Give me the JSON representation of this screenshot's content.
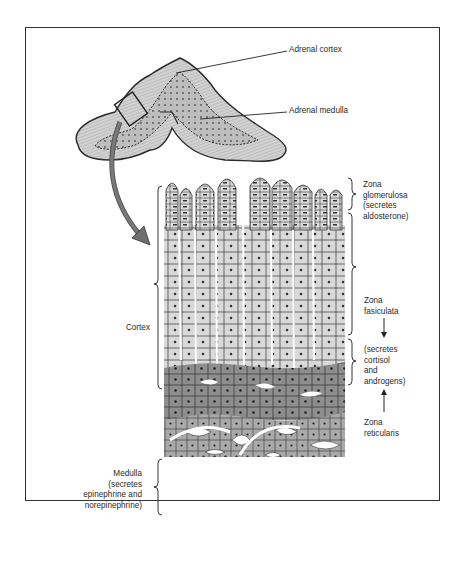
{
  "diagram": {
    "colors": {
      "outline": "#2b2b2b",
      "gland_fill": "#c9c9c9",
      "cortex_cells_light": "#d6d6d6",
      "reticularis_cells": "#8f8f8f",
      "medulla_cells": "#a8a8a8",
      "arrow": "#6f6f6f",
      "background": "#ffffff"
    },
    "gland_labels": {
      "cortex": "Adrenal cortex",
      "medulla": "Adrenal medulla"
    },
    "zones": {
      "glomerulosa": {
        "line1": "Zona",
        "line2": "glomerulosa",
        "line3": "(secretes",
        "line4": "aldosterone)"
      },
      "fasciculata": {
        "line1": "Zona",
        "line2": "fasiculata"
      },
      "fasciculata_reticularis_secretion": {
        "line1": "(secretes",
        "line2": "cortisol",
        "line3": "and",
        "line4": "androgens)"
      },
      "reticularis": {
        "line1": "Zona",
        "line2": "reticularis"
      }
    },
    "left_labels": {
      "cortex": "Cortex",
      "medulla": {
        "line1": "Medulla",
        "line2": "(secretes",
        "line3": "epinephrine and",
        "line4": "norepinephrine)"
      }
    }
  }
}
